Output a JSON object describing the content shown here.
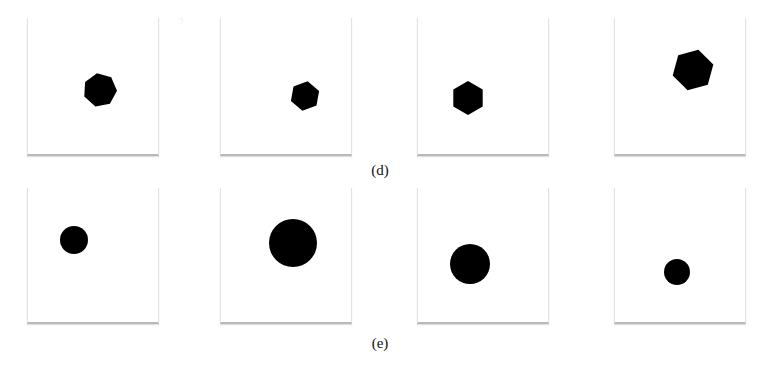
{
  "figure": {
    "rows": [
      {
        "label": "(d)",
        "label_pos": [
          380,
          162
        ],
        "panel_top": 18,
        "panel_height": 136,
        "panels": [
          {
            "left": 27,
            "shape": "heptagon",
            "cx": 72,
            "cy": 72,
            "r": 17,
            "rot": -10
          },
          {
            "left": 220,
            "shape": "hexagon",
            "cx": 84,
            "cy": 78,
            "r": 15,
            "rot": 10
          },
          {
            "left": 417,
            "shape": "hexagon",
            "cx": 50,
            "cy": 80,
            "r": 17,
            "rot": 0
          },
          {
            "left": 614,
            "shape": "hexagon",
            "cx": 78,
            "cy": 52,
            "r": 21,
            "rot": 15
          }
        ]
      },
      {
        "label": "(e)",
        "label_pos": [
          380,
          335
        ],
        "panel_top": 188,
        "panel_height": 134,
        "panels": [
          {
            "left": 27,
            "shape": "circle",
            "cx": 46,
            "cy": 52,
            "r": 14
          },
          {
            "left": 220,
            "shape": "circle",
            "cx": 72,
            "cy": 55,
            "r": 24
          },
          {
            "left": 417,
            "shape": "circle",
            "cx": 52,
            "cy": 76,
            "r": 20
          },
          {
            "left": 614,
            "shape": "circle",
            "cx": 62,
            "cy": 84,
            "r": 13
          }
        ]
      }
    ],
    "shape_color": "#000000"
  },
  "ghost_text": "         ，    ，           ，            ，\n          ，         ，               ，\n\n\n\n\n\n\n\n\n\n"
}
